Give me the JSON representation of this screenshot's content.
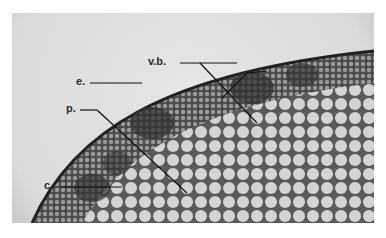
{
  "figure": {
    "labels": [
      {
        "id": "vb",
        "text": "v.b.",
        "meaning": "vascular bundle"
      },
      {
        "id": "e",
        "text": "e.",
        "meaning": "epidermis"
      },
      {
        "id": "p",
        "text": "p.",
        "meaning": "pith / parenchyma"
      },
      {
        "id": "c",
        "text": "c.",
        "meaning": "cortex"
      }
    ]
  }
}
